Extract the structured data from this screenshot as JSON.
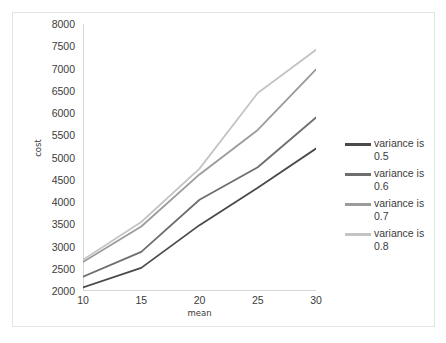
{
  "chart_data": {
    "type": "line",
    "title": "",
    "xlabel": "mean",
    "ylabel": "cost",
    "x": [
      10,
      15,
      20,
      25,
      30
    ],
    "xticklabels": [
      "10",
      "15",
      "20",
      "25",
      "30"
    ],
    "xlim": [
      10,
      30
    ],
    "ylim": [
      2000,
      8000
    ],
    "yticks": [
      2000,
      2500,
      3000,
      3500,
      4000,
      4500,
      5000,
      5500,
      6000,
      6500,
      7000,
      7500,
      8000
    ],
    "yticklabels": [
      "8000",
      "7500",
      "7000",
      "6500",
      "6000",
      "5500",
      "5000",
      "4500",
      "4000",
      "3500",
      "3000",
      "2500",
      "2000"
    ],
    "grid": false,
    "legend_position": "right",
    "series": [
      {
        "name": "variance is 0.5",
        "color": "#4a4a4a",
        "values": [
          2080,
          2520,
          3480,
          4320,
          5200
        ]
      },
      {
        "name": "variance is 0.6",
        "color": "#6e6e6e",
        "values": [
          2320,
          2880,
          4050,
          4780,
          5900
        ]
      },
      {
        "name": "variance is 0.7",
        "color": "#9b9b9b",
        "values": [
          2650,
          3450,
          4620,
          5620,
          6980
        ]
      },
      {
        "name": "variance is 0.8",
        "color": "#c4c4c4",
        "values": [
          2700,
          3550,
          4750,
          6450,
          7420
        ]
      }
    ]
  },
  "legend": {
    "items": [
      {
        "label": "variance is 0.5",
        "color": "#4a4a4a"
      },
      {
        "label": "variance is 0.6",
        "color": "#6e6e6e"
      },
      {
        "label": "variance is 0.7",
        "color": "#9b9b9b"
      },
      {
        "label": "variance is 0.8",
        "color": "#c4c4c4"
      }
    ]
  }
}
